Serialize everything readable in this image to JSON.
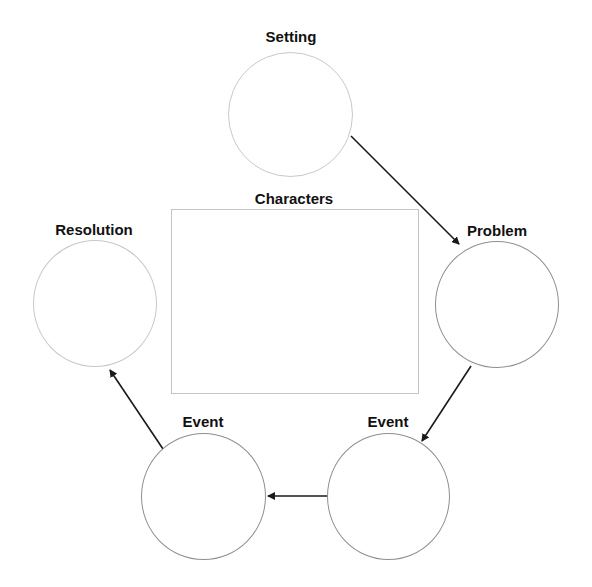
{
  "diagram": {
    "labels": {
      "setting": "Setting",
      "characters": "Characters",
      "problem": "Problem",
      "event_right": "Event",
      "event_left": "Event",
      "resolution": "Resolution"
    },
    "colors": {
      "arrow": "#1a1a1a",
      "light_outline": "#c8c8c8",
      "dark_outline": "#8e8e8e",
      "label_text": "#111111"
    },
    "flow": [
      "Setting",
      "Problem",
      "Event",
      "Event",
      "Resolution"
    ]
  }
}
